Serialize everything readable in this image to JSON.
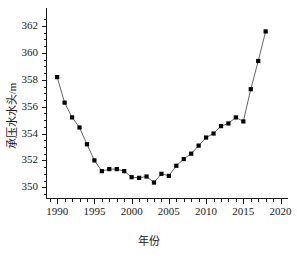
{
  "chart_data": {
    "type": "line",
    "title": "",
    "xlabel": "年份",
    "ylabel": "承压水水头/m",
    "xlim": [
      1988.5,
      2021.0
    ],
    "ylim": [
      349.2,
      362.6
    ],
    "xticks": [
      1990,
      1995,
      2000,
      2005,
      2010,
      2015,
      2020
    ],
    "xtick_labels": [
      "1990",
      "1995",
      "2000",
      "2005",
      "2010",
      "2015",
      "2020"
    ],
    "yticks": [
      350,
      352,
      354,
      356,
      358,
      360,
      362
    ],
    "ytick_labels": [
      "350",
      "352",
      "354",
      "356",
      "358",
      "360",
      "362"
    ],
    "x_minor_step": 1,
    "y_minor_step": 0.5,
    "grid": false,
    "legend": null,
    "marker": "square",
    "marker_color": "#000000",
    "line_color": "#555555",
    "spines": [
      "left",
      "bottom"
    ],
    "x": [
      1990,
      1991,
      1992,
      1993,
      1994,
      1995,
      1996,
      1997,
      1998,
      1999,
      2000,
      2001,
      2002,
      2003,
      2004,
      2005,
      2006,
      2007,
      2008,
      2009,
      2010,
      2011,
      2012,
      2013,
      2014,
      2015,
      2016,
      2017,
      2018
    ],
    "values": [
      358.2,
      356.3,
      355.2,
      354.45,
      353.2,
      352.0,
      351.2,
      351.35,
      351.35,
      351.2,
      350.75,
      350.7,
      350.8,
      350.35,
      351.0,
      350.85,
      351.6,
      352.1,
      352.5,
      353.1,
      353.7,
      354.0,
      354.55,
      354.75,
      355.2,
      354.9,
      357.3,
      359.4,
      361.6
    ],
    "series_name": "承压水水头"
  }
}
